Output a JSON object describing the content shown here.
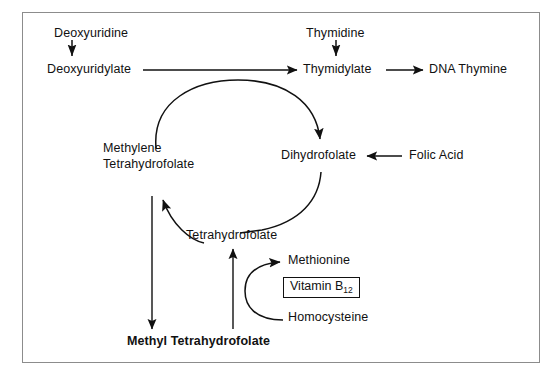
{
  "figure": {
    "frame_color": "#8c8c8c",
    "line_color": "#111111",
    "background": "#ffffff"
  },
  "nodes": {
    "deoxyuridine": "Deoxyuridine",
    "deoxyuridylate": "Deoxyuridylate",
    "thymidine": "Thymidine",
    "thymidylate": "Thymidylate",
    "dna_thymine": "DNA Thymine",
    "methylene_thf_line1": "Methylene",
    "methylene_thf_line2": "Tetrahydrofolate",
    "dihydrofolate": "Dihydrofolate",
    "folic_acid": "Folic Acid",
    "tetrahydrofolate": "Tetrahydrofolate",
    "methionine": "Methionine",
    "vitamin_b12_label": "Vitamin B",
    "vitamin_b12_subscript": "12",
    "homocysteine": "Homocysteine",
    "methyl_tetrahydrofolate": "Methyl Tetrahydrofolate"
  },
  "arrows": [
    {
      "name": "deoxyuridine-to-deoxyuridylate",
      "from": "Deoxyuridine",
      "to": "Deoxyuridylate",
      "style": "straight-vertical-down"
    },
    {
      "name": "deoxyuridylate-to-thymidylate",
      "from": "Deoxyuridylate",
      "to": "Thymidylate",
      "style": "straight-horizontal-right"
    },
    {
      "name": "thymidine-to-thymidylate",
      "from": "Thymidine",
      "to": "Thymidylate",
      "style": "straight-vertical-down"
    },
    {
      "name": "thymidylate-to-dna-thymine",
      "from": "Thymidylate",
      "to": "DNA Thymine",
      "style": "straight-horizontal-right"
    },
    {
      "name": "methylene-thf-to-dihydrofolate",
      "from": "Methylene Tetrahydrofolate",
      "to": "Dihydrofolate",
      "style": "curved-arc-over-top"
    },
    {
      "name": "folic-acid-to-dihydrofolate",
      "from": "Folic Acid",
      "to": "Dihydrofolate",
      "style": "straight-horizontal-left"
    },
    {
      "name": "dihydrofolate-to-methylene-thf",
      "from": "Dihydrofolate",
      "to": "Methylene Tetrahydrofolate",
      "style": "curved-arc-under-via-tetrahydrofolate"
    },
    {
      "name": "methylene-thf-to-methyl-thf",
      "from": "Methylene Tetrahydrofolate",
      "to": "Methyl Tetrahydrofolate",
      "style": "straight-vertical-down"
    },
    {
      "name": "methyl-thf-to-tetrahydrofolate",
      "from": "Methyl Tetrahydrofolate",
      "to": "Tetrahydrofolate",
      "style": "straight-vertical-up"
    },
    {
      "name": "homocysteine-to-methionine",
      "from": "Homocysteine",
      "to": "Methionine",
      "style": "curved-c-shape"
    }
  ]
}
